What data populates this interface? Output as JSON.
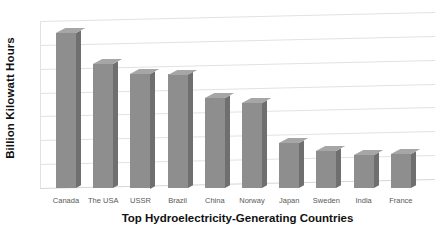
{
  "chart_data": {
    "type": "bar",
    "title": "",
    "xlabel": "Top Hydroelectricity-Generating Countries",
    "ylabel": "Billion Kilowatt Hours",
    "categories": [
      "Canada",
      "The USA",
      "USSR",
      "Brazil",
      "China",
      "Norway",
      "Japan",
      "Sweden",
      "India",
      "France"
    ],
    "values": [
      325,
      260,
      240,
      238,
      188,
      178,
      95,
      77,
      69,
      71
    ],
    "ylim": [
      0,
      350
    ],
    "yticks": [
      0,
      50,
      100,
      150,
      200,
      250,
      300,
      350
    ],
    "ytick_labels": [
      "0",
      "50",
      "100",
      "150",
      "200",
      "250",
      "300",
      "350"
    ],
    "grid": true,
    "legend": false,
    "legend_position": "none",
    "style": "3d-column",
    "colors": {
      "bar_face": "#8e8e8e",
      "bar_side": "#6f6f6f",
      "bar_top": "#a6a6a6",
      "gridline": "#e2e2e2",
      "tick_text": "#595959",
      "axis_title_text": "#111111",
      "background": "#ffffff"
    }
  }
}
